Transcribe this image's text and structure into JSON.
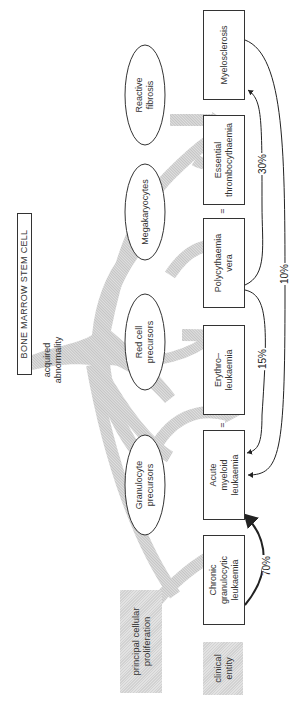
{
  "diagram": {
    "root": {
      "label": "BONE MARROW STEM CELL"
    },
    "trunk_label": "acquired abnormality",
    "row_labels": {
      "proliferation": "principal cellular proliferation",
      "clinical": "clinical entity"
    },
    "proliferations": [
      {
        "id": "granulocyte",
        "label_l1": "Granulocyte",
        "label_l2": "precursors"
      },
      {
        "id": "redcell",
        "label_l1": "Red cell",
        "label_l2": "precursors"
      },
      {
        "id": "megakaryocytes",
        "label_l1": "Megakaryocytes",
        "label_l2": ""
      },
      {
        "id": "fibrosis",
        "label_l1": "Reactive",
        "label_l2": "fibrosis"
      }
    ],
    "entities": [
      {
        "id": "cgl",
        "label_l1": "Chronic",
        "label_l2": "granulocytic",
        "label_l3": "leukaemia"
      },
      {
        "id": "aml",
        "label_l1": "Acute",
        "label_l2": "myeloid",
        "label_l3": "leukaemia"
      },
      {
        "id": "erythro",
        "label_l1": "Erythro–",
        "label_l2": "leukaemia",
        "label_l3": ""
      },
      {
        "id": "pv",
        "label_l1": "Polycythaemia",
        "label_l2": "vera",
        "label_l3": ""
      },
      {
        "id": "et",
        "label_l1": "Essential",
        "label_l2": "thrombocythaemia",
        "label_l3": ""
      },
      {
        "id": "myelo",
        "label_l1": "Myelosclerosis",
        "label_l2": "",
        "label_l3": ""
      }
    ],
    "equals_sign": "=",
    "transitions": [
      {
        "from": "Chronic granulocytic leukaemia",
        "to": "Acute myeloid leukaemia",
        "label": "70%"
      },
      {
        "from": "Polycythaemia vera",
        "to": "Acute myeloid leukaemia",
        "label": "15%"
      },
      {
        "from": "Polycythaemia vera",
        "to": "Myelosclerosis",
        "label": "30%"
      },
      {
        "from": "Myelosclerosis",
        "to": "Acute myeloid leukaemia",
        "label": "10%"
      }
    ],
    "colors": {
      "arrow_fill": "#d0d0d0",
      "line": "#222222",
      "shade": "#dcdcdc"
    }
  }
}
